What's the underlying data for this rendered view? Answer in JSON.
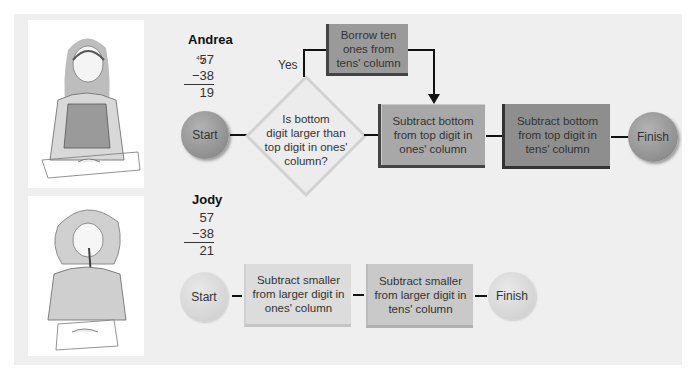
{
  "colors": {
    "panel_bg": "#efefef",
    "andrea_start": "#9c9c9c",
    "andrea_box_ones": "#a8a8a8",
    "andrea_box_tens": "#8e8e8e",
    "andrea_borrow": "#9a9a9a",
    "jody_start": "#d8d8d8",
    "jody_box_ones": "#dcdcdc",
    "jody_box_tens": "#c9c9c9",
    "connector": "#111111"
  },
  "andrea": {
    "name": "Andrea",
    "calc": {
      "borrow_mark": "4",
      "top": "57",
      "top_tens": "5",
      "top_ones": "7",
      "bottom": "−38",
      "result": "19"
    },
    "flow": {
      "start": "Start",
      "decision": [
        "Is bottom",
        "digit larger than",
        "top digit in ones'",
        "column?"
      ],
      "yes_label": "Yes",
      "borrow": [
        "Borrow ten",
        "ones from",
        "tens' column"
      ],
      "step_ones": [
        "Subtract bottom",
        "from top digit in",
        "ones' column"
      ],
      "step_tens": [
        "Subtract bottom",
        "from top digit in",
        "tens' column"
      ],
      "finish": "Finish"
    }
  },
  "jody": {
    "name": "Jody",
    "calc": {
      "top": "57",
      "bottom": "−38",
      "result": "21"
    },
    "flow": {
      "start": "Start",
      "step_ones": [
        "Subtract smaller",
        "from larger digit in",
        "ones' column"
      ],
      "step_tens": [
        "Subtract smaller",
        "from larger digit in",
        "tens' column"
      ],
      "finish": "Finish"
    }
  },
  "illustrations": {
    "andrea_image": "girl-writing-illustration",
    "jody_image": "girl-thinking-illustration"
  }
}
